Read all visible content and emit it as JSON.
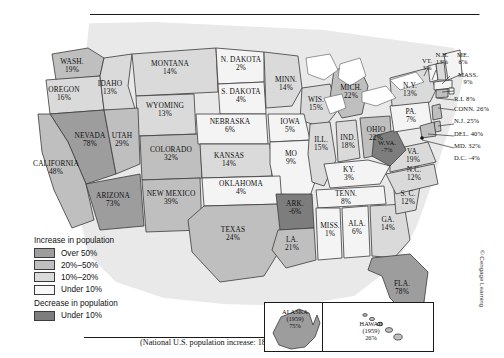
{
  "figure": {
    "national_note": "(National U.S. population increase: 18.5%)",
    "credit": "© Cengage Learning"
  },
  "legend": {
    "increase_title": "Increase in population",
    "decrease_title": "Decrease in population",
    "increase_items": [
      {
        "label": "Over 50%",
        "color": "#9d9d9d"
      },
      {
        "label": "20%–50%",
        "color": "#bfbfbf"
      },
      {
        "label": "10%–20%",
        "color": "#dadada"
      },
      {
        "label": "Under 10%",
        "color": "#f4f4f4"
      }
    ],
    "decrease_items": [
      {
        "label": "Under 10%",
        "color": "#7d7d7d"
      }
    ]
  },
  "inset": {
    "alaska": {
      "name": "ALASKA",
      "year": "(1959)",
      "value": "75%"
    },
    "hawaii": {
      "name": "HAWAII",
      "year": "(1959)",
      "value": "26%"
    }
  },
  "states": [
    {
      "id": "WA",
      "name": "WASH.",
      "value": "19%",
      "class": "20-50"
    },
    {
      "id": "OR",
      "name": "OREGON",
      "value": "16%",
      "class": "10-20"
    },
    {
      "id": "ID",
      "name": "IDAHO",
      "value": "13%",
      "class": "10-20"
    },
    {
      "id": "MT",
      "name": "MONTANA",
      "value": "14%",
      "class": "10-20"
    },
    {
      "id": "WY",
      "name": "WYOMING",
      "value": "13%",
      "class": "10-20"
    },
    {
      "id": "ND",
      "name": "N. DAKOTA",
      "value": "2%",
      "class": "under10"
    },
    {
      "id": "SD",
      "name": "S. DAKOTA",
      "value": "4%",
      "class": "under10"
    },
    {
      "id": "NE",
      "name": "NEBRASKA",
      "value": "6%",
      "class": "under10"
    },
    {
      "id": "MN",
      "name": "MINN.",
      "value": "14%",
      "class": "10-20"
    },
    {
      "id": "WI",
      "name": "WIS.",
      "value": "15%",
      "class": "10-20"
    },
    {
      "id": "IA",
      "name": "IOWA",
      "value": "5%",
      "class": "under10"
    },
    {
      "id": "MI",
      "name": "MICH.",
      "value": "22%",
      "class": "20-50"
    },
    {
      "id": "NV",
      "name": "NEVADA",
      "value": "78%",
      "class": "over50"
    },
    {
      "id": "UT",
      "name": "UTAH",
      "value": "29%",
      "class": "20-50"
    },
    {
      "id": "CO",
      "name": "COLORADO",
      "value": "32%",
      "class": "20-50"
    },
    {
      "id": "KS",
      "name": "KANSAS",
      "value": "14%",
      "class": "10-20"
    },
    {
      "id": "CA",
      "name": "CALIFORNIA",
      "value": "48%",
      "class": "20-50"
    },
    {
      "id": "AZ",
      "name": "ARIZONA",
      "value": "73%",
      "class": "over50"
    },
    {
      "id": "NM",
      "name": "NEW MEXICO",
      "value": "39%",
      "class": "20-50"
    },
    {
      "id": "OK",
      "name": "OKLAHOMA",
      "value": "4%",
      "class": "under10"
    },
    {
      "id": "TX",
      "name": "TEXAS",
      "value": "24%",
      "class": "20-50"
    },
    {
      "id": "MO",
      "name": "MO",
      "value": "9%",
      "class": "under10"
    },
    {
      "id": "AR",
      "name": "ARK.",
      "value": "-6%",
      "class": "dec"
    },
    {
      "id": "LA",
      "name": "LA.",
      "value": "21%",
      "class": "20-50"
    },
    {
      "id": "IL",
      "name": "ILL.",
      "value": "15%",
      "class": "10-20"
    },
    {
      "id": "IN",
      "name": "IND.",
      "value": "18%",
      "class": "10-20"
    },
    {
      "id": "OH",
      "name": "OHIO",
      "value": "22%",
      "class": "20-50"
    },
    {
      "id": "KY",
      "name": "KY.",
      "value": "3%",
      "class": "under10"
    },
    {
      "id": "TN",
      "name": "TENN.",
      "value": "8%",
      "class": "under10"
    },
    {
      "id": "MS",
      "name": "MISS.",
      "value": "1%",
      "class": "under10"
    },
    {
      "id": "AL",
      "name": "ALA.",
      "value": "6%",
      "class": "under10"
    },
    {
      "id": "GA",
      "name": "GA.",
      "value": "14%",
      "class": "10-20"
    },
    {
      "id": "FL",
      "name": "FLA.",
      "value": "78%",
      "class": "over50"
    },
    {
      "id": "SC",
      "name": "S. C.",
      "value": "12%",
      "class": "10-20"
    },
    {
      "id": "NC",
      "name": "N.C.",
      "value": "12%",
      "class": "10-20"
    },
    {
      "id": "VA",
      "name": "VA.",
      "value": "19%",
      "class": "10-20"
    },
    {
      "id": "WV",
      "name": "W.VA.",
      "value": "-7%",
      "class": "dec"
    },
    {
      "id": "PA",
      "name": "PA.",
      "value": "7%",
      "class": "under10"
    },
    {
      "id": "NY",
      "name": "N.Y.",
      "value": "13%",
      "class": "10-20"
    },
    {
      "id": "VT",
      "name": "VT.",
      "value": "3%",
      "class": "under10"
    },
    {
      "id": "NH",
      "name": "N.H.",
      "value": "13%",
      "class": "10-20"
    },
    {
      "id": "ME",
      "name": "ME.",
      "value": "6%",
      "class": "under10"
    },
    {
      "id": "MA",
      "name": "MASS.",
      "value": "9%",
      "class": "under10"
    },
    {
      "id": "RI",
      "name": "R.I.",
      "value": "8%",
      "class": "under10"
    },
    {
      "id": "CT",
      "name": "CONN.",
      "value": "26%",
      "class": "20-50"
    },
    {
      "id": "NJ",
      "name": "N.J.",
      "value": "25%",
      "class": "20-50"
    },
    {
      "id": "DE",
      "name": "DEL.",
      "value": "40%",
      "class": "20-50"
    },
    {
      "id": "MD",
      "name": "MD.",
      "value": "32%",
      "class": "20-50"
    },
    {
      "id": "DC",
      "name": "D.C.",
      "value": "-4%",
      "class": "dec"
    }
  ]
}
